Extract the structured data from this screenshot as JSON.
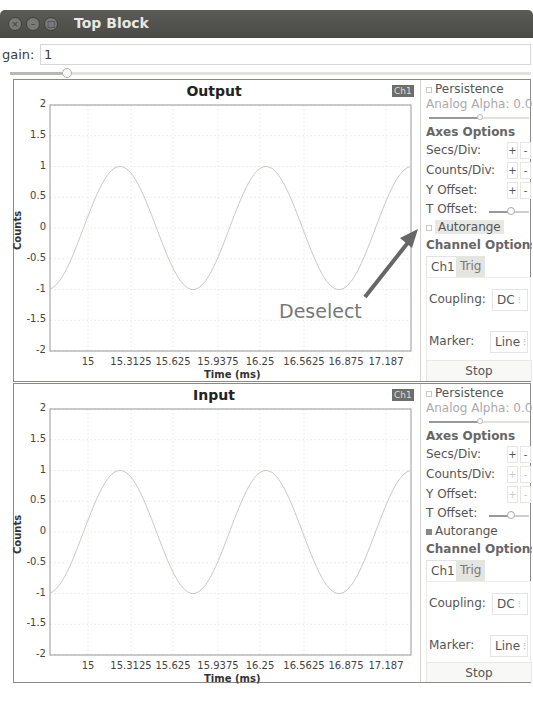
{
  "window": {
    "title": "Top Block",
    "buttons": [
      "close",
      "minimize",
      "maximize"
    ]
  },
  "gain": {
    "label": "gain:",
    "value": "1",
    "slider_position_pct": 10
  },
  "annotation": {
    "text": "Deselect",
    "arrow_color": "#666666"
  },
  "scopes": [
    {
      "title": "Output",
      "channel_tag": "Ch1",
      "ylabel": "Counts",
      "xlabel": "Time (ms)",
      "yticks": [
        "2",
        "1.5",
        "1",
        "0.5",
        "0",
        "-0.5",
        "-1",
        "-1.5",
        "-2"
      ],
      "xticks": [
        "15",
        "15.3125",
        "15.625",
        "15.9375",
        "16.25",
        "16.5625",
        "16.875",
        "17.187"
      ],
      "panel": {
        "persistence": "Persistence",
        "analog_alpha": "Analog Alpha: 0.09",
        "axes_options": "Axes Options",
        "secs_div": "Secs/Div:",
        "counts_div": "Counts/Div:",
        "y_offset": "Y Offset:",
        "t_offset": "T Offset:",
        "autorange": "Autorange",
        "autorange_checked": false,
        "channel_options": "Channel Options",
        "tabs": [
          "Ch1",
          "Trig"
        ],
        "coupling_label": "Coupling:",
        "coupling_value": "DC",
        "marker_label": "Marker:",
        "marker_value": "Line",
        "stop": "Stop",
        "plus": "+",
        "minus": "-"
      }
    },
    {
      "title": "Input",
      "channel_tag": "Ch1",
      "ylabel": "Counts",
      "xlabel": "Time (ms)",
      "yticks": [
        "2",
        "1.5",
        "1",
        "0.5",
        "0",
        "-0.5",
        "-1",
        "-1.5",
        "-2"
      ],
      "xticks": [
        "15",
        "15.3125",
        "15.625",
        "15.9375",
        "16.25",
        "16.5625",
        "16.875",
        "17.187"
      ],
      "panel": {
        "persistence": "Persistence",
        "analog_alpha": "Analog Alpha: 0.09",
        "axes_options": "Axes Options",
        "secs_div": "Secs/Div:",
        "counts_div": "Counts/Div:",
        "y_offset": "Y Offset:",
        "t_offset": "T Offset:",
        "autorange": "Autorange",
        "autorange_checked": true,
        "channel_options": "Channel Options",
        "tabs": [
          "Ch1",
          "Trig"
        ],
        "coupling_label": "Coupling:",
        "coupling_value": "DC",
        "marker_label": "Marker:",
        "marker_value": "Line",
        "stop": "Stop",
        "plus": "+",
        "minus": "-"
      }
    }
  ],
  "chart_data": [
    {
      "type": "line",
      "title": "Output",
      "xlabel": "Time (ms)",
      "ylabel": "Counts",
      "ylim": [
        -2,
        2
      ],
      "xlim": [
        14.85,
        17.3
      ],
      "grid": true,
      "series": [
        {
          "name": "Ch1",
          "description": "sine wave, amplitude 1, period ~1.06 ms",
          "x": [
            14.85,
            15.115,
            15.38,
            15.645,
            15.91,
            16.175,
            16.44,
            16.705,
            16.97,
            17.235,
            17.3
          ],
          "values": [
            -1,
            0,
            1,
            0,
            -1,
            0,
            1,
            0,
            -1,
            0,
            1
          ]
        }
      ]
    },
    {
      "type": "line",
      "title": "Input",
      "xlabel": "Time (ms)",
      "ylabel": "Counts",
      "ylim": [
        -2,
        2
      ],
      "xlim": [
        14.85,
        17.3
      ],
      "grid": true,
      "series": [
        {
          "name": "Ch1",
          "description": "sine wave, amplitude 1, period ~1.06 ms",
          "x": [
            14.85,
            15.115,
            15.38,
            15.645,
            15.91,
            16.175,
            16.44,
            16.705,
            16.97,
            17.235,
            17.3
          ],
          "values": [
            -1,
            0,
            1,
            0,
            -1,
            0,
            1,
            0,
            -1,
            0,
            1
          ]
        }
      ]
    }
  ]
}
